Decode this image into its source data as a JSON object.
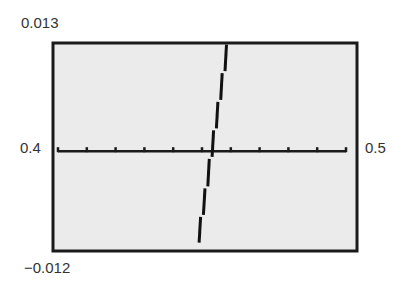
{
  "labels": {
    "ymax": "0.013",
    "ymin": "−0.012",
    "xmin": "0.4",
    "xmax": "0.5"
  },
  "colors": {
    "background": "#ebebeb",
    "frame": "#1a1a1a",
    "axis": "#1a1a1a",
    "curve": "#111111",
    "text": "#333333"
  },
  "chart_data": {
    "type": "line",
    "title": "",
    "xlabel": "",
    "ylabel": "",
    "xlim": [
      0.4,
      0.5
    ],
    "ylim": [
      -0.012,
      0.013
    ],
    "x_ticks_scale": 0.01,
    "x_ticks": [
      0.4,
      0.41,
      0.42,
      0.43,
      0.44,
      0.45,
      0.46,
      0.47,
      0.48,
      0.49,
      0.5
    ],
    "grid": false,
    "legend": null,
    "series": [
      {
        "name": "f(x)",
        "style": "stepped calculator-pixel line",
        "x": [
          0.449,
          0.4505,
          0.452,
          0.4535,
          0.455,
          0.4565,
          0.458,
          0.4594
        ],
        "y": [
          -0.011,
          -0.0077,
          -0.0043,
          -0.0008,
          0.0026,
          0.006,
          0.0094,
          0.0128
        ]
      }
    ],
    "annotations": [
      "x-axis crossing (root) near x ≈ 0.453"
    ]
  }
}
